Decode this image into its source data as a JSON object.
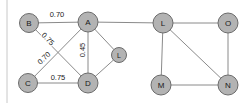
{
  "diagram": {
    "colors": {
      "node_fill": "#b3b3b3",
      "node_stroke": "#6b6b6b",
      "edge_stroke": "#8a8a8a",
      "label_text": "#1a1a1a",
      "frame": "#c8c8c8",
      "background": "#ffffff"
    },
    "nodes": [
      {
        "id": "B",
        "label": "B",
        "x": 29,
        "y": 23,
        "r": 9.5,
        "size": "normal"
      },
      {
        "id": "A",
        "label": "A",
        "x": 88,
        "y": 22,
        "r": 10,
        "size": "normal"
      },
      {
        "id": "C",
        "label": "C",
        "x": 28,
        "y": 83,
        "r": 9.5,
        "size": "normal"
      },
      {
        "id": "D",
        "label": "D",
        "x": 88,
        "y": 83,
        "r": 10,
        "size": "normal"
      },
      {
        "id": "L1",
        "label": "L",
        "x": 119,
        "y": 55,
        "r": 7.5,
        "size": "small"
      },
      {
        "id": "L2",
        "label": "L",
        "x": 163,
        "y": 23,
        "r": 10,
        "size": "normal"
      },
      {
        "id": "O",
        "label": "O",
        "x": 228,
        "y": 23,
        "r": 10,
        "size": "normal"
      },
      {
        "id": "M",
        "label": "M",
        "x": 161,
        "y": 85,
        "r": 10,
        "size": "normal"
      },
      {
        "id": "N",
        "label": "N",
        "x": 228,
        "y": 85,
        "r": 10,
        "size": "normal"
      }
    ],
    "edges": [
      {
        "from": "B",
        "to": "A",
        "label": "0.70",
        "label_x": 57,
        "label_y": 14,
        "label_rotation": 0
      },
      {
        "from": "B",
        "to": "D",
        "label": "0.75",
        "label_x": 48,
        "label_y": 39,
        "label_rotation": 46
      },
      {
        "from": "C",
        "to": "A",
        "label": "0.70",
        "label_x": 44,
        "label_y": 58,
        "label_rotation": -44
      },
      {
        "from": "C",
        "to": "D",
        "label": "0.75",
        "label_x": 58,
        "label_y": 77,
        "label_rotation": 0
      },
      {
        "from": "A",
        "to": "D",
        "label": "0.45",
        "label_x": 82,
        "label_y": 50,
        "label_rotation": -90
      },
      {
        "from": "A",
        "to": "L1",
        "label": "",
        "label_x": 0,
        "label_y": 0,
        "label_rotation": 0
      },
      {
        "from": "D",
        "to": "L1",
        "label": "",
        "label_x": 0,
        "label_y": 0,
        "label_rotation": 0
      },
      {
        "from": "A",
        "to": "L2",
        "label": "",
        "label_x": 0,
        "label_y": 0,
        "label_rotation": 0
      },
      {
        "from": "L2",
        "to": "O",
        "label": "",
        "label_x": 0,
        "label_y": 0,
        "label_rotation": 0
      },
      {
        "from": "L2",
        "to": "M",
        "label": "",
        "label_x": 0,
        "label_y": 0,
        "label_rotation": 0
      },
      {
        "from": "L2",
        "to": "N",
        "label": "",
        "label_x": 0,
        "label_y": 0,
        "label_rotation": 0
      },
      {
        "from": "O",
        "to": "N",
        "label": "",
        "label_x": 0,
        "label_y": 0,
        "label_rotation": 0
      },
      {
        "from": "M",
        "to": "N",
        "label": "",
        "label_x": 0,
        "label_y": 0,
        "label_rotation": 0
      }
    ],
    "frame": {
      "left_border_x": 7,
      "left_border_top": 0,
      "left_border_bottom": 103
    }
  }
}
